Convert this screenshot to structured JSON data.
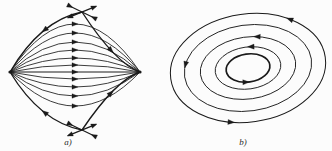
{
  "figure": {
    "background_color": "#fcfcfc",
    "stroke_color": "#1a1a1a",
    "width": 332,
    "height": 151
  },
  "panels": [
    {
      "id": "panel-a",
      "label": "a)",
      "label_x": 68,
      "label_y": 145,
      "kind": "heteroclinic-lens",
      "description": "Two saddle points joined by a family of heteroclinic trajectories forming a lens (eye) shape, with separatrix arrows crossing at the upper and lower saddles.",
      "left_node": {
        "x": 10,
        "y": 72
      },
      "right_node": {
        "x": 140,
        "y": 72
      },
      "top_saddle": {
        "x": 82,
        "y": 12
      },
      "bottom_saddle": {
        "x": 82,
        "y": 130
      },
      "inner_trajectory_count": 11,
      "inner_curve_offsets": [
        -48,
        -39,
        -30,
        -22,
        -14,
        -7,
        0,
        7,
        15,
        24,
        34
      ],
      "flow_direction": "left-to-right",
      "arrow_positions_t": [
        0.5
      ],
      "boundary_arrow_count": 4
    },
    {
      "id": "panel-b",
      "label": "b)",
      "label_x": 243,
      "label_y": 145,
      "kind": "center-vortex",
      "description": "A center (vortex): five nested, slightly tilted closed orbits traversed clockwise.",
      "center": {
        "x": 248,
        "y": 68
      },
      "tilt_degrees": -8,
      "orbit_count": 5,
      "orbits": [
        {
          "rx": 78,
          "ry": 54,
          "stroke_width": 1.0
        },
        {
          "rx": 64,
          "ry": 43,
          "stroke_width": 0.9
        },
        {
          "rx": 48,
          "ry": 31,
          "stroke_width": 0.9
        },
        {
          "rx": 33,
          "ry": 21,
          "stroke_width": 0.9
        },
        {
          "rx": 22,
          "ry": 14,
          "stroke_width": 1.7
        }
      ],
      "rotation_sense": "clockwise",
      "arrow_count": 6
    }
  ]
}
